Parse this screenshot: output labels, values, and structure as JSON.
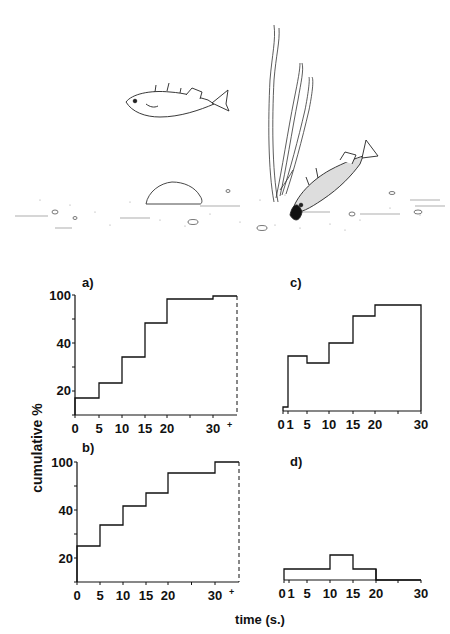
{
  "figure": {
    "illustration": {
      "description": "Two sticklebacks: one swimming, one digging a pit in the sandy bottom beside a water plant",
      "elements": [
        "swimming-fish",
        "digging-fish",
        "water-plant",
        "stone",
        "sandy-bottom",
        "pebbles"
      ]
    },
    "y_axis_label": "cumulative %",
    "x_axis_label": "time (s.)",
    "panels": [
      "a)",
      "b)",
      "c)",
      "d)"
    ]
  },
  "chart_data": [
    {
      "type": "line",
      "step": true,
      "panel": "a)",
      "title": "a)",
      "xlabel": "time (s.)",
      "ylabel": "cumulative %",
      "x_ticks": [
        "0",
        "5",
        "10",
        "15",
        "20",
        "30",
        "+"
      ],
      "y_ticks": [
        "20",
        "40",
        "100"
      ],
      "y_scale": "nonlinear (probability-style)",
      "bins": [
        "0-5",
        "5-10",
        "10-15",
        "15-20",
        "20-30",
        "30-30+"
      ],
      "values": [
        17,
        23,
        34,
        58,
        95,
        98
      ],
      "end_marker": "dashed vertical line at 30+",
      "grid": false,
      "px": {
        "x0": 75,
        "xs": [
          75,
          99,
          122,
          145,
          167,
          213,
          237
        ],
        "ys": [
          398,
          383,
          357,
          323,
          299,
          296
        ],
        "top": 295,
        "bottom": 415
      }
    },
    {
      "type": "line",
      "step": true,
      "panel": "b)",
      "title": "b)",
      "xlabel": "time (s.)",
      "ylabel": "cumulative %",
      "x_ticks": [
        "0",
        "5",
        "10",
        "15",
        "20",
        "30",
        "+"
      ],
      "y_ticks": [
        "20",
        "40",
        "100"
      ],
      "y_scale": "nonlinear (probability-style)",
      "bins": [
        "0-5",
        "5-10",
        "10-15",
        "15-20",
        "20-30",
        "30-30+"
      ],
      "values": [
        25,
        33,
        44,
        60,
        85,
        100
      ],
      "end_marker": "dashed vertical line at 30+",
      "grid": false,
      "px": {
        "x0": 77,
        "xs": [
          77,
          100,
          123,
          146,
          168,
          215,
          239
        ],
        "ys": [
          546,
          525,
          506,
          493,
          473,
          462
        ],
        "top": 462,
        "bottom": 582
      }
    },
    {
      "type": "line",
      "step": true,
      "panel": "c)",
      "title": "c)",
      "xlabel": "time (s.)",
      "x_ticks": [
        "0",
        "1",
        "5",
        "10",
        "15",
        "20",
        "30"
      ],
      "y_ticks": [],
      "bins": [
        "0-1",
        "1-5",
        "5-10",
        "10-15",
        "15-20",
        "20-30"
      ],
      "values": [
        13,
        34,
        31,
        40,
        63,
        85
      ],
      "grid": false,
      "px": {
        "x0": 283,
        "xs": [
          283,
          288,
          307,
          329,
          353,
          375,
          421
        ],
        "ys": [
          407,
          356,
          363,
          343,
          316,
          305
        ],
        "bottom": 411
      }
    },
    {
      "type": "bar",
      "step": true,
      "panel": "d)",
      "title": "d)",
      "xlabel": "time (s.)",
      "x_ticks": [
        "0",
        "1",
        "5",
        "10",
        "15",
        "20",
        "30"
      ],
      "y_ticks": [],
      "bins": [
        "0-10",
        "10-15",
        "15-20",
        "20-30"
      ],
      "values": [
        1,
        2,
        1,
        0
      ],
      "note": "relative heights only; no y-axis labels",
      "grid": false,
      "px": {
        "x0": 284,
        "xs": [
          284,
          330,
          353,
          376,
          421
        ],
        "ys": [
          569,
          555,
          569,
          580
        ],
        "bottom": 580
      }
    }
  ]
}
